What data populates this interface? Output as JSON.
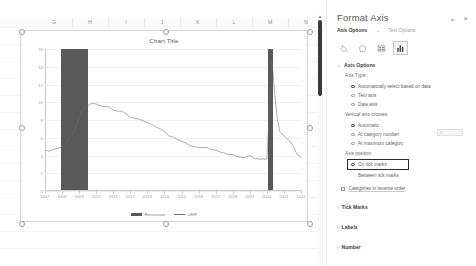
{
  "spreadsheet": {
    "column_headers": [
      "G",
      "H",
      "I",
      "J",
      "K",
      "L",
      "M",
      "N"
    ]
  },
  "chart_data": {
    "type": "line",
    "title": "Chart Title",
    "xlabel": "",
    "ylabel": "",
    "ylim": [
      0,
      16
    ],
    "ytick_labels": [
      "16",
      "14",
      "12",
      "10",
      "8",
      "6",
      "4",
      "2",
      "0"
    ],
    "yticks": [
      16,
      14,
      12,
      10,
      8,
      6,
      4,
      2,
      0
    ],
    "grid": true,
    "legend_position": "bottom",
    "xtick_labels": [
      "2007",
      "2008",
      "2009",
      "2010",
      "2011",
      "2012",
      "2013",
      "2014",
      "2015",
      "2016",
      "2017",
      "2018",
      "2019",
      "2020",
      "2021",
      "2022"
    ],
    "series": [
      {
        "name": "UER",
        "type": "line",
        "color": "#6b6b6b",
        "x": [
          2007.0,
          2007.25,
          2007.5,
          2007.75,
          2008.0,
          2008.25,
          2008.5,
          2008.75,
          2009.0,
          2009.25,
          2009.5,
          2009.75,
          2010.0,
          2010.25,
          2010.5,
          2010.75,
          2011.0,
          2011.25,
          2011.5,
          2011.75,
          2012.0,
          2012.25,
          2012.5,
          2012.75,
          2013.0,
          2013.25,
          2013.5,
          2013.75,
          2014.0,
          2014.25,
          2014.5,
          2014.75,
          2015.0,
          2015.25,
          2015.5,
          2015.75,
          2016.0,
          2016.25,
          2016.5,
          2016.75,
          2017.0,
          2017.25,
          2017.5,
          2017.75,
          2018.0,
          2018.25,
          2018.5,
          2018.75,
          2019.0,
          2019.25,
          2019.5,
          2019.75,
          2020.0,
          2020.3,
          2020.45,
          2020.6,
          2020.75,
          2021.0,
          2021.25,
          2021.5,
          2021.75,
          2022.0
        ],
        "values": [
          4.6,
          4.5,
          4.7,
          4.8,
          5.0,
          5.4,
          6.1,
          6.9,
          8.3,
          9.3,
          9.6,
          9.9,
          9.8,
          9.6,
          9.5,
          9.5,
          9.1,
          9.0,
          9.0,
          8.7,
          8.3,
          8.2,
          8.1,
          7.9,
          7.7,
          7.5,
          7.2,
          7.0,
          6.7,
          6.2,
          6.1,
          5.8,
          5.6,
          5.4,
          5.1,
          5.0,
          4.9,
          4.9,
          4.9,
          4.7,
          4.6,
          4.4,
          4.3,
          4.1,
          4.1,
          3.9,
          3.8,
          3.8,
          4.0,
          3.7,
          3.6,
          3.6,
          3.6,
          14.7,
          11.1,
          8.4,
          6.7,
          6.2,
          5.8,
          5.2,
          4.2,
          3.8
        ]
      },
      {
        "name": "Recession",
        "type": "shaded_bars",
        "color": "#595959",
        "bands": [
          {
            "start": 2007.95,
            "end": 2009.5
          },
          {
            "start": 2020.05,
            "end": 2020.35
          }
        ]
      }
    ],
    "legend": [
      {
        "label": "Recession",
        "marker": "bar",
        "color": "#595959"
      },
      {
        "label": "UER",
        "marker": "line",
        "color": "#6b6b6b"
      }
    ]
  },
  "pane": {
    "title": "Format Axis",
    "collapse_label": "⌄",
    "close_label": "×",
    "tabs": [
      {
        "label": "Axis Options",
        "active": true,
        "chevron": "⌄"
      },
      {
        "label": "Text Options",
        "active": false
      }
    ],
    "icons": [
      {
        "name": "fill-icon",
        "selected": false
      },
      {
        "name": "effects-icon",
        "selected": false
      },
      {
        "name": "size-properties-icon",
        "selected": false
      },
      {
        "name": "axis-options-chart-icon",
        "selected": true
      }
    ],
    "sections": [
      {
        "label": "Axis Options",
        "expanded": true,
        "chevron": "⌄"
      },
      {
        "label": "Tick Marks",
        "expanded": false,
        "chevron": "›"
      },
      {
        "label": "Labels",
        "expanded": false,
        "chevron": "›"
      },
      {
        "label": "Number",
        "expanded": false,
        "chevron": "›"
      }
    ],
    "axis_type": {
      "label": "Axis Type",
      "options": [
        {
          "label": "Automatically select based on data",
          "selected": true
        },
        {
          "label": "Text axis",
          "selected": false
        },
        {
          "label": "Date axis",
          "selected": false
        }
      ]
    },
    "vertical_axis_crosses": {
      "label": "Vertical axis crosses",
      "options": [
        {
          "label": "Automatic",
          "selected": true
        },
        {
          "label": "At category number",
          "selected": false,
          "value": "1"
        },
        {
          "label": "At maximum category",
          "selected": false
        }
      ]
    },
    "axis_position": {
      "label": "Axis position",
      "options": [
        {
          "label": "On tick marks",
          "selected": true,
          "focused": true
        },
        {
          "label": "Between tick marks",
          "selected": false
        }
      ]
    },
    "categories_reverse": {
      "label": "Categories in reverse order",
      "checked": false
    }
  }
}
